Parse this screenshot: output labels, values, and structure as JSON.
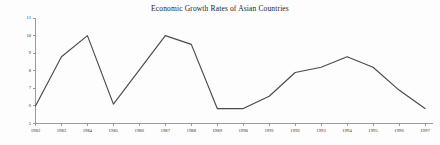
{
  "chart_data": {
    "type": "line",
    "title": "Economic Growth Rates of Asian Countries",
    "xlabel": "",
    "ylabel": "",
    "grid": false,
    "legend": "none",
    "xlim": [
      1982,
      1997
    ],
    "ylim": [
      5,
      11
    ],
    "y_ticks": [
      5,
      6,
      7,
      8,
      9,
      10,
      11
    ],
    "y_tick_labels": [
      "5",
      "6",
      "7",
      "8",
      "9",
      "10",
      "11"
    ],
    "categories": [
      "1982",
      "1983",
      "1984",
      "1985",
      "1986",
      "1987",
      "1988",
      "1989",
      "1990",
      "1991",
      "1992",
      "1993",
      "1994",
      "1995",
      "1996",
      "1997"
    ],
    "values": [
      6.0,
      8.8,
      10.0,
      6.1,
      8.05,
      10.0,
      9.5,
      5.85,
      5.85,
      6.55,
      7.9,
      8.2,
      8.8,
      8.2,
      6.9,
      5.85
    ],
    "series": [
      {
        "name": "Economic Growth Rate",
        "values": [
          6.0,
          8.8,
          10.0,
          6.1,
          8.05,
          10.0,
          9.5,
          5.85,
          5.85,
          6.55,
          7.9,
          8.2,
          8.8,
          8.2,
          6.9,
          5.85
        ],
        "color": "#4a4a4a"
      }
    ]
  },
  "figure": {
    "background_color": "#fdfdfd",
    "axis_color": "#9a9a9a",
    "line_color": "#4a4a4a"
  }
}
